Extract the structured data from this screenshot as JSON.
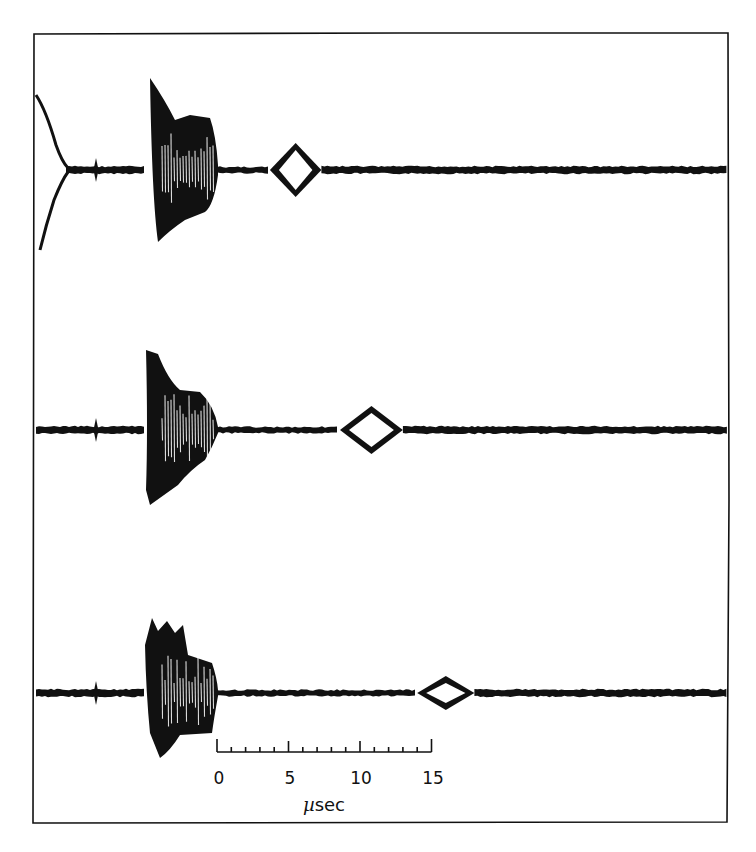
{
  "chart_data": {
    "type": "line",
    "title": "",
    "xlabel": "µsec",
    "ylabel": "",
    "scale_bar": {
      "ticks": [
        0,
        5,
        10,
        15
      ],
      "minor_tick_interval": 1,
      "unit": "µsec",
      "range": [
        0,
        15
      ]
    },
    "grid": false,
    "legend": null,
    "series": [
      {
        "name": "trace-1",
        "has_initial_decay": true,
        "marker_spike_us": -8.5,
        "burst_start_us": -5,
        "burst_end_us": 0,
        "echo_center_us": 5.5,
        "echo_half_width_us": 1.8
      },
      {
        "name": "trace-2",
        "has_initial_decay": false,
        "marker_spike_us": -8.5,
        "burst_start_us": -5,
        "burst_end_us": 0,
        "echo_center_us": 10.8,
        "echo_half_width_us": 2.2
      },
      {
        "name": "trace-3",
        "has_initial_decay": false,
        "marker_spike_us": -8.5,
        "burst_start_us": -5,
        "burst_end_us": 0,
        "echo_center_us": 16,
        "echo_half_width_us": 2.0
      }
    ]
  },
  "axis": {
    "tick_labels": [
      "0",
      "5",
      "10",
      "15"
    ],
    "unit_mu": "µ",
    "unit_text": "sec"
  },
  "colors": {
    "ink": "#111111",
    "paper": "#ffffff"
  }
}
